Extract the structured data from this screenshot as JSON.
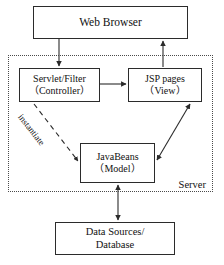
{
  "diagram": {
    "type": "block-diagram",
    "canvas": {
      "width": 224,
      "height": 265
    },
    "style": {
      "line_color": "#2b2b2b",
      "box_fill": "#ffffff",
      "background": "#ffffff",
      "dotted_border_color": "#4a4a4a"
    },
    "nodes": {
      "web_browser": {
        "label": "Web Browser"
      },
      "servlet": {
        "line1": "Servlet/Filter",
        "line2": "（Controller）"
      },
      "jsp": {
        "line1": "JSP pages",
        "line2": "（View）"
      },
      "javabeans": {
        "line1": "JavaBeans",
        "line2": "（Model）"
      },
      "datasource": {
        "line1": "Data Sources/",
        "line2": "Database"
      }
    },
    "regions": {
      "server": {
        "label": "Server",
        "border_style": "dotted"
      }
    },
    "edges": {
      "browser_to_servlet": {
        "label": "",
        "arrow": "single",
        "direction": "down"
      },
      "jsp_to_browser": {
        "label": "",
        "arrow": "single",
        "direction": "up"
      },
      "servlet_to_jsp": {
        "label": "",
        "arrow": "single",
        "direction": "right"
      },
      "servlet_to_javabeans": {
        "label": "instantiate",
        "arrow": "single",
        "style": "dashed",
        "direction": "diagonal-down-right"
      },
      "javabeans_to_jsp": {
        "label": "",
        "arrow": "double",
        "direction": "diagonal"
      },
      "javabeans_to_datasource": {
        "label": "",
        "arrow": "double",
        "direction": "vertical"
      }
    }
  }
}
